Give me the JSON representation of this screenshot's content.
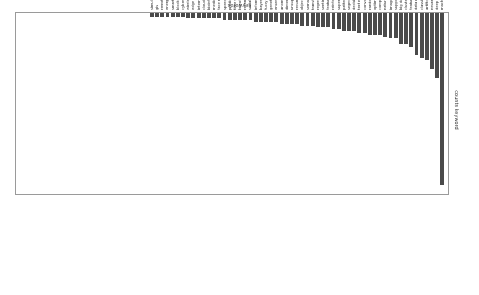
{
  "chart_data": {
    "type": "bar",
    "title": "",
    "xlabel": "keywords",
    "ylabel": "counts keyword",
    "orientation": "rotated-180",
    "grid": false,
    "legend": null,
    "bar_color": "#4a4a4a",
    "frame_color": "#9a9a9a",
    "ylim": [
      0,
      100
    ],
    "categories": [
      "machine learning",
      "deep learning",
      "neural network",
      "artificial intelligence",
      "classification",
      "data mining",
      "feature selection",
      "clustering",
      "big data",
      "support vector machine",
      "image processing",
      "natural language processing",
      "computer vision",
      "optimization",
      "random forest",
      "convolutional neural network",
      "text mining",
      "decision tree",
      "segmentation",
      "pattern recognition",
      "supervised learning",
      "reinforcement learning",
      "feature extraction",
      "sentiment analysis",
      "regression",
      "transfer learning",
      "semantic segmentation",
      "object detection",
      "recurrent neural network",
      "unsupervised learning",
      "dimensionality reduction",
      "anomaly detection",
      "ensemble learning",
      "genetic algorithm",
      "fuzzy logic",
      "bayesian network",
      "information retrieval",
      "social network",
      "recommender system",
      "knowledge graph",
      "time series",
      "prediction model",
      "speech recognition",
      "face recognition",
      "medical imaging",
      "bioinformatics",
      "cloud computing",
      "internet of things",
      "edge computing",
      "wireless sensor network",
      "cyber security",
      "blockchain",
      "smart grid",
      "energy efficiency",
      "remote sensing",
      "gis",
      "simulation"
    ],
    "values": [
      95,
      36,
      31,
      26,
      25,
      23,
      19,
      17,
      17,
      14,
      14,
      13,
      12,
      12,
      12,
      11,
      11,
      10,
      10,
      10,
      9,
      9,
      8,
      8,
      8,
      7,
      7,
      7,
      6,
      6,
      6,
      6,
      5,
      5,
      5,
      5,
      5,
      4,
      4,
      4,
      4,
      4,
      4,
      3,
      3,
      3,
      3,
      3,
      3,
      3,
      2,
      2,
      2,
      2,
      2,
      2,
      2
    ]
  }
}
